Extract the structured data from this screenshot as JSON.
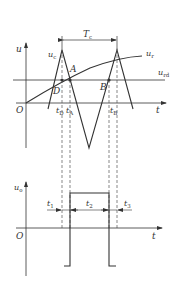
{
  "diagram": {
    "type": "pwm-timing",
    "colors": {
      "line": "#333333",
      "dashed": "#555555",
      "background": "#ffffff"
    },
    "upper_plot": {
      "y_axis_label": "u",
      "x_axis_label": "t",
      "origin_label": "O",
      "carrier_label": {
        "main": "u",
        "sub": "c"
      },
      "reference_label": {
        "main": "u",
        "sub": "r"
      },
      "threshold_label": {
        "main": "u",
        "sub": "rd"
      },
      "period_label": {
        "main": "T",
        "sub": "c"
      },
      "points": [
        {
          "name": "A",
          "label": "A"
        },
        {
          "name": "B",
          "label": "B"
        },
        {
          "name": "D",
          "label": "D"
        }
      ],
      "time_marks": [
        {
          "main": "t",
          "sub": "D"
        },
        {
          "main": "t",
          "sub": "A"
        },
        {
          "main": "t",
          "sub": "B"
        }
      ]
    },
    "lower_plot": {
      "y_axis_label": {
        "main": "u",
        "sub": "o"
      },
      "x_axis_label": "t",
      "origin_label": "O",
      "intervals": [
        {
          "main": "t",
          "sub": "1"
        },
        {
          "main": "t",
          "sub": "2"
        },
        {
          "main": "t",
          "sub": "3"
        }
      ]
    }
  }
}
